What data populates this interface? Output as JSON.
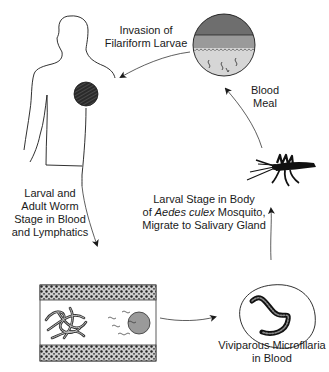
{
  "diagram": {
    "labels": {
      "invasion": [
        "Invasion of",
        "Filariform Larvae"
      ],
      "blood_meal": [
        "Blood",
        "Meal"
      ],
      "larval_adult": [
        "Larval and",
        "Adult Worm",
        "Stage in Blood",
        "and Lymphatics"
      ],
      "mosquito_stage": {
        "line1": "Larval Stage in Body",
        "line2_prefix": "of ",
        "line2_italic": "Aedes culex",
        "line2_suffix": " Mosquito,",
        "line3": "Migrate to Salivary Gland"
      },
      "microfilaria": [
        "Viviparous Microfilaria",
        "in Blood"
      ]
    },
    "colors": {
      "ink": "#1a1a1a",
      "skin_dark": "#6e6e6e",
      "skin_mid": "#9a9a9a",
      "skin_light": "#d6d6d6",
      "vessel_wall": "#3a3a3a",
      "worm_fill": "#8a8a8a"
    }
  }
}
